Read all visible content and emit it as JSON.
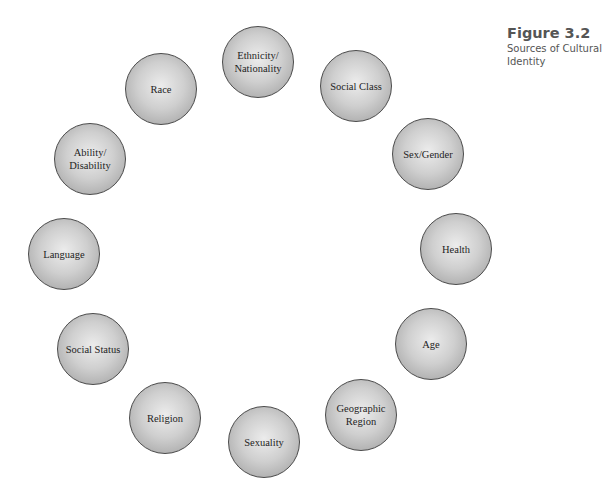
{
  "caption": {
    "figure_number": "Figure 3.2",
    "title": "Sources of Cultural\nIdentity"
  },
  "diagram": {
    "type": "circular-ring",
    "colors": {
      "node_fill_center": "#ececec",
      "node_fill_edge": "#979797",
      "node_border": "#4a4a4a",
      "text": "#1e1e1e"
    },
    "nodes": [
      {
        "label": "Ethnicity/\nNationality",
        "cx": 258,
        "cy": 62
      },
      {
        "label": "Social Class",
        "cx": 356,
        "cy": 86
      },
      {
        "label": "Sex/Gender",
        "cx": 428,
        "cy": 154
      },
      {
        "label": "Health",
        "cx": 456,
        "cy": 249
      },
      {
        "label": "Age",
        "cx": 431,
        "cy": 344
      },
      {
        "label": "Geographic\nRegion",
        "cx": 361,
        "cy": 415
      },
      {
        "label": "Sexuality",
        "cx": 264,
        "cy": 442
      },
      {
        "label": "Religion",
        "cx": 165,
        "cy": 418
      },
      {
        "label": "Social Status",
        "cx": 93,
        "cy": 349
      },
      {
        "label": "Language",
        "cx": 64,
        "cy": 254
      },
      {
        "label": "Ability/\nDisability",
        "cx": 90,
        "cy": 159
      },
      {
        "label": "Race",
        "cx": 161,
        "cy": 89
      }
    ]
  }
}
